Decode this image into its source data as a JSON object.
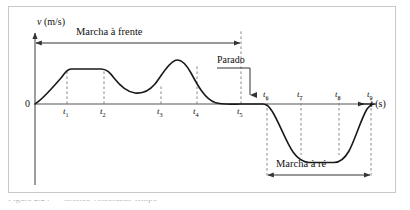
{
  "figure": {
    "axes": {
      "y_label": "v (m/s)",
      "y_label_var": "v",
      "y_label_unit": " (m/s)",
      "x_label": "t (s)",
      "x_label_var": "t",
      "x_label_unit": " (s)",
      "origin_label": "0"
    },
    "tick_labels": [
      {
        "id": "t1",
        "base": "t",
        "sub": "1"
      },
      {
        "id": "t2",
        "base": "t",
        "sub": "2"
      },
      {
        "id": "t3",
        "base": "t",
        "sub": "3"
      },
      {
        "id": "t4",
        "base": "t",
        "sub": "4"
      },
      {
        "id": "t5",
        "base": "t",
        "sub": "5"
      },
      {
        "id": "t6",
        "base": "t",
        "sub": "6"
      },
      {
        "id": "t7",
        "base": "t",
        "sub": "7"
      },
      {
        "id": "t8",
        "base": "t",
        "sub": "8"
      },
      {
        "id": "t9",
        "base": "t",
        "sub": "9"
      }
    ],
    "annotations": {
      "forward_span": "Marcha à frente",
      "reverse_span": "Marcha à ré",
      "stopped_callout": "Parado"
    },
    "caption_clipped": "Figura 2.24 — Gráfico velocidade-tempo",
    "colors": {
      "curve": "#1a1a1a",
      "axis": "#555555",
      "dashed": "#7a7a7a",
      "frame": "#c8c8c8",
      "text": "#111111"
    }
  },
  "chart_data": {
    "type": "line",
    "title": "",
    "xlabel": "t (s)",
    "ylabel": "v (m/s)",
    "xlim": [
      0,
      370
    ],
    "ylim": [
      -62,
      52
    ],
    "grid": false,
    "legend": null,
    "series": [
      {
        "name": "velocidade",
        "points": [
          [
            0,
            0
          ],
          [
            10,
            10
          ],
          [
            20,
            23
          ],
          [
            30,
            34
          ],
          [
            40,
            39
          ],
          [
            52,
            40
          ],
          [
            65,
            40
          ],
          [
            80,
            40
          ],
          [
            95,
            40
          ],
          [
            108,
            39
          ],
          [
            118,
            34
          ],
          [
            128,
            26
          ],
          [
            138,
            21
          ],
          [
            148,
            19
          ],
          [
            158,
            20
          ],
          [
            168,
            26
          ],
          [
            176,
            36
          ],
          [
            182,
            44
          ],
          [
            188,
            46
          ],
          [
            194,
            42
          ],
          [
            200,
            32
          ],
          [
            208,
            18
          ],
          [
            216,
            7
          ],
          [
            224,
            1
          ],
          [
            232,
            0
          ],
          [
            244,
            0
          ],
          [
            252,
            0
          ],
          [
            258,
            -2
          ],
          [
            264,
            -10
          ],
          [
            272,
            -26
          ],
          [
            280,
            -40
          ],
          [
            288,
            -48
          ],
          [
            296,
            -51
          ],
          [
            308,
            -52
          ],
          [
            320,
            -52
          ],
          [
            330,
            -51
          ],
          [
            338,
            -46
          ],
          [
            346,
            -33
          ],
          [
            354,
            -16
          ],
          [
            362,
            -5
          ],
          [
            370,
            -1
          ],
          [
            378,
            0
          ],
          [
            390,
            0
          ]
        ]
      }
    ],
    "tick_positions_x": {
      "t1": 58,
      "t2": 95,
      "t3": 152,
      "t4": 188,
      "t5": 232,
      "t6": 258,
      "t7": 292,
      "t8": 330,
      "t9": 362
    },
    "annotations": [
      {
        "label": "Marcha à frente",
        "type": "double-arrow-span",
        "from_x": 0,
        "to_x": 232
      },
      {
        "label": "Marcha à ré",
        "type": "double-arrow-span",
        "from_x": 258,
        "to_x": 362
      },
      {
        "label": "Parado",
        "type": "callout-arrow",
        "target_x": 240,
        "target_y": 0
      }
    ]
  }
}
